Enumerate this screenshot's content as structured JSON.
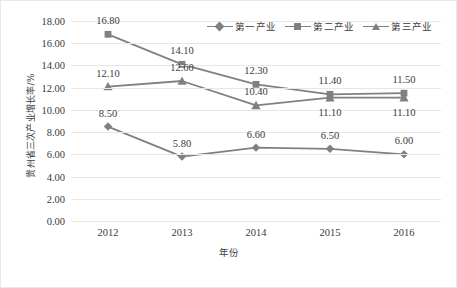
{
  "chart_data": {
    "type": "line",
    "title": "",
    "xlabel": "年份",
    "ylabel": "贵州省三次产业增长率/%",
    "x": [
      "2012",
      "2013",
      "2014",
      "2015",
      "2016"
    ],
    "categories": [
      "2012",
      "2013",
      "2014",
      "2015",
      "2016"
    ],
    "ylim": [
      0.0,
      18.0
    ],
    "ytick_step": 2.0,
    "yticks": [
      "18.00",
      "16.00",
      "14.00",
      "12.00",
      "10.00",
      "8.00",
      "6.00",
      "4.00",
      "2.00",
      "0.00"
    ],
    "ytick_values": [
      18.0,
      16.0,
      14.0,
      12.0,
      10.0,
      8.0,
      6.0,
      4.0,
      2.0,
      0.0
    ],
    "grid": true,
    "legend_position": "top-right",
    "series": [
      {
        "name": "第一产业",
        "marker": "diamond",
        "color": "#808080",
        "values": [
          8.5,
          5.8,
          6.6,
          6.5,
          6.0
        ],
        "labels": [
          "8.50",
          "5.80",
          "6.60",
          "6.50",
          "6.00"
        ],
        "label_position": "above"
      },
      {
        "name": "第二产业",
        "marker": "square",
        "color": "#808080",
        "values": [
          16.8,
          14.1,
          12.3,
          11.4,
          11.5
        ],
        "labels": [
          "16.80",
          "14.10",
          "12.30",
          "11.40",
          "11.50"
        ],
        "label_position": "above"
      },
      {
        "name": "第三产业",
        "marker": "triangle",
        "color": "#808080",
        "values": [
          12.1,
          12.6,
          10.4,
          11.1,
          11.1
        ],
        "labels": [
          "12.10",
          "12.60",
          "10.40",
          "11.10",
          "11.10"
        ],
        "label_position": "mixed"
      }
    ]
  },
  "legend": {
    "entries": [
      {
        "label": "第一产业",
        "marker": "diamond"
      },
      {
        "label": "第二产业",
        "marker": "square"
      },
      {
        "label": "第三产业",
        "marker": "triangle"
      }
    ]
  },
  "axes": {
    "y_title": "贵州省三次产业增长率/%",
    "x_title": "年份"
  },
  "colors": {
    "line": "#808080",
    "marker": "#808080",
    "grid": "#e6e6e6",
    "text": "#3a3a3a",
    "background": "#ffffff",
    "border": "#e8e8e8"
  }
}
